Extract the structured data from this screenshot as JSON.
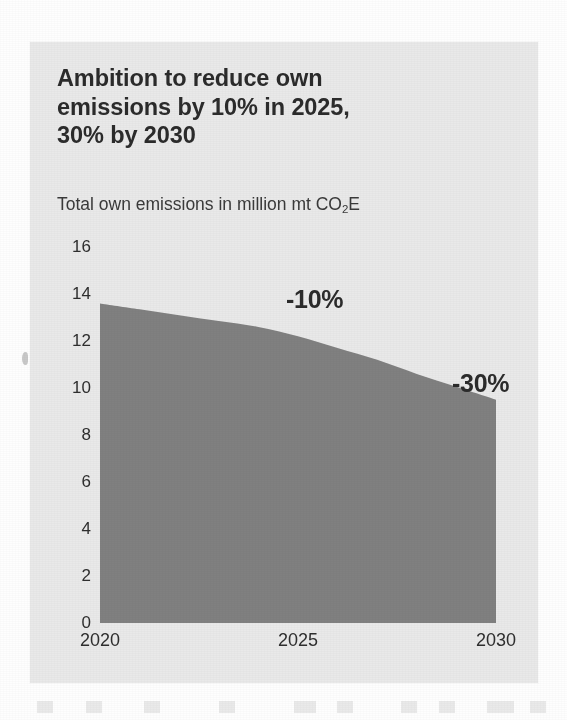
{
  "figure": {
    "title_lines": [
      "Ambition to reduce own",
      "emissions by 10% in 2025,",
      "30% by 2030"
    ],
    "subtitle_prefix": "Total own emissions in million mt CO",
    "subtitle_subscript": "2",
    "subtitle_suffix": "E",
    "panel_background": "#e9e9e9",
    "area_color": "#808080",
    "text_color": "#2b2b2b"
  },
  "chart_data": {
    "type": "area",
    "title": "Ambition to reduce own emissions by 10% in 2025, 30% by 2030",
    "subtitle": "Total own emissions in million mt CO2E",
    "xlabel": "",
    "ylabel": "Total own emissions in million mt CO2E",
    "x": [
      2020,
      2021,
      2022,
      2023,
      2024,
      2025,
      2026,
      2027,
      2028,
      2029,
      2030
    ],
    "values": [
      13.6,
      13.35,
      13.1,
      12.85,
      12.6,
      12.2,
      11.7,
      11.2,
      10.6,
      10.05,
      9.5
    ],
    "xticks": [
      "2020",
      "2025",
      "2030"
    ],
    "xtick_values": [
      2020,
      2025,
      2030
    ],
    "yticks": [
      "0",
      "2",
      "4",
      "6",
      "8",
      "10",
      "12",
      "14",
      "16"
    ],
    "ytick_values": [
      0,
      2,
      4,
      6,
      8,
      10,
      12,
      14,
      16
    ],
    "xlim": [
      2020,
      2030
    ],
    "ylim": [
      0,
      16
    ],
    "grid": false,
    "legend": "none",
    "annotations": [
      {
        "text": "-10%",
        "x": 2025,
        "y": 14.4
      },
      {
        "text": "-30%",
        "x": 2030,
        "y": 11.0
      }
    ]
  }
}
